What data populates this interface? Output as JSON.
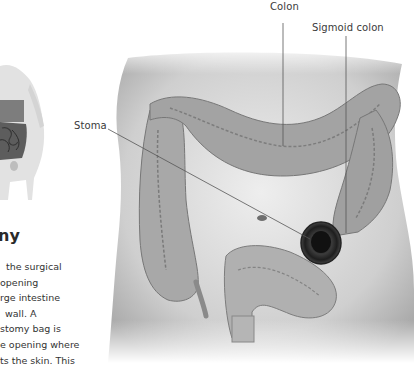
{
  "illustration": {
    "labels": {
      "colon": "Colon",
      "sigmoid_colon": "Sigmoid colon",
      "stoma": "Stoma"
    }
  },
  "article": {
    "heading_fragment": "ny",
    "body_lines": [
      "the surgical",
      "opening",
      "rge intestine",
      " wall. A",
      "stomy bag is",
      "e opening where",
      "ts the skin. This"
    ]
  },
  "colors": {
    "background": "#ffffff",
    "text": "#333333",
    "leader_line": "#555555",
    "skin": "#d9d9d9",
    "colon": "#9a9a9a",
    "stoma": "#2a2a2a"
  }
}
